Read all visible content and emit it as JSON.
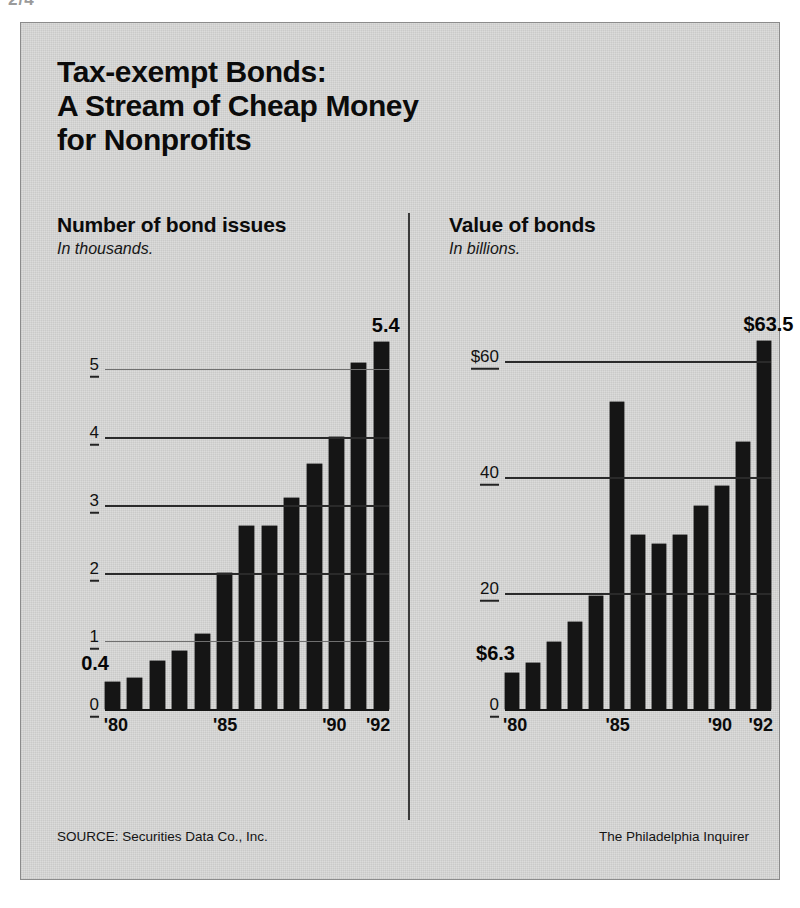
{
  "corner_mark": "2/4",
  "title": {
    "line1": "Tax-exempt Bonds:",
    "line2": "A Stream of Cheap Money",
    "line3": "for Nonprofits"
  },
  "footer": {
    "source": "SOURCE: Securities Data Co., Inc.",
    "credit": "The Philadelphia Inquirer"
  },
  "colors": {
    "bar": "#151515",
    "background": "#dcdcdb",
    "text": "#0b0b0b",
    "gridline": "#2a2a2a"
  },
  "chart_data": [
    {
      "type": "bar",
      "id": "number-of-bond-issues",
      "title": "Number of bond issues",
      "subtitle": "In thousands.",
      "xlabel": "",
      "ylabel": "In thousands",
      "ylim": [
        0,
        5.8
      ],
      "grid": true,
      "legend": "none",
      "categories": [
        "1980",
        "1981",
        "1982",
        "1983",
        "1984",
        "1985",
        "1986",
        "1987",
        "1988",
        "1989",
        "1990",
        "1991",
        "1992"
      ],
      "tick_labels_x": [
        "'80",
        "'85",
        "'90",
        "'92"
      ],
      "tick_positions_x": [
        0,
        5,
        10,
        12
      ],
      "tick_labels_y": [
        "0",
        "1",
        "2",
        "3",
        "4",
        "5"
      ],
      "tick_values_y": [
        0,
        1,
        2,
        3,
        4,
        5
      ],
      "values": [
        0.4,
        0.45,
        0.7,
        0.85,
        1.1,
        2.0,
        2.7,
        2.7,
        3.1,
        3.6,
        4.0,
        5.1,
        5.4
      ],
      "annotations": [
        {
          "label": "0.4",
          "index": 0,
          "position": "left-of-first-bar"
        },
        {
          "label": "5.4",
          "index": 12,
          "position": "above-last-bar"
        }
      ]
    },
    {
      "type": "bar",
      "id": "value-of-bonds",
      "title": "Value of bonds",
      "subtitle": "In billions.",
      "xlabel": "",
      "ylabel": "In billions of dollars",
      "ylim": [
        0,
        68
      ],
      "grid": true,
      "legend": "none",
      "categories": [
        "1980",
        "1981",
        "1982",
        "1983",
        "1984",
        "1985",
        "1986",
        "1987",
        "1988",
        "1989",
        "1990",
        "1991",
        "1992"
      ],
      "tick_labels_x": [
        "'80",
        "'85",
        "'90",
        "'92"
      ],
      "tick_positions_x": [
        0,
        5,
        10,
        12
      ],
      "tick_labels_y": [
        "0",
        "20",
        "40",
        "$60"
      ],
      "tick_values_y": [
        0,
        20,
        40,
        60
      ],
      "values": [
        6.3,
        8.0,
        11.5,
        15.0,
        19.5,
        53.0,
        30.0,
        28.5,
        30.0,
        35.0,
        38.5,
        46.0,
        63.5
      ],
      "annotations": [
        {
          "label": "$6.3",
          "index": 0,
          "position": "left-of-first-bar"
        },
        {
          "label": "$63.5",
          "index": 12,
          "position": "above-last-bar"
        }
      ]
    }
  ]
}
